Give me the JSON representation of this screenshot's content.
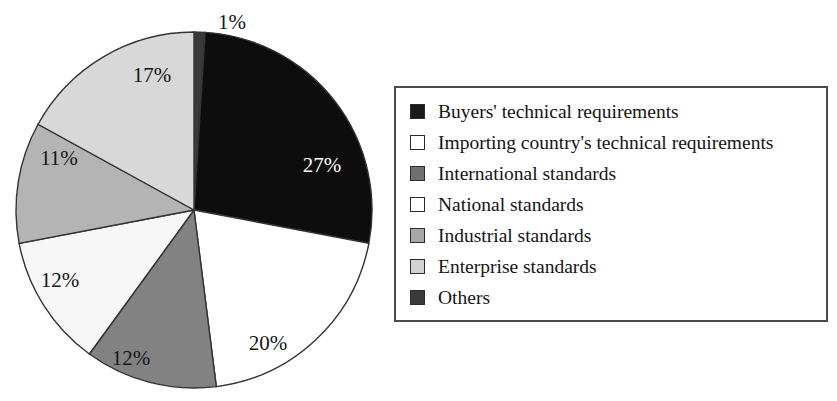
{
  "chart_data": {
    "type": "pie",
    "title": "",
    "subtitle": "",
    "xlabel": "",
    "ylabel": "",
    "grid": false,
    "legend_position": "right",
    "units": "percent",
    "start_angle_deg": 0,
    "direction": "clockwise",
    "categories": [
      "Buyers' technical requirements",
      "Importing country's technical requirements",
      "International standards",
      "National standards",
      "Industrial standards",
      "Enterprise standards",
      "Others"
    ],
    "values": [
      27,
      20,
      12,
      12,
      11,
      17,
      1
    ],
    "value_labels": [
      "27%",
      "20%",
      "12%",
      "12%",
      "11%",
      "17%",
      "1%"
    ],
    "colors": [
      "#0d0d0d",
      "#ffffff",
      "#828282",
      "#f7f7f7",
      "#b4b4b4",
      "#d8d8d8",
      "#3a3a3a"
    ],
    "slices": [
      {
        "name": "Others",
        "label": "1%",
        "value": 1,
        "color": "#3a3a3a",
        "label_color": "#151515",
        "label_x": 232,
        "label_y": 24,
        "start_pct": 0,
        "end_pct": 1
      },
      {
        "name": "Buyers' technical requirements",
        "label": "27%",
        "value": 27,
        "color": "#0d0d0d",
        "label_color": "#ffffff",
        "label_x": 322,
        "label_y": 167,
        "start_pct": 1,
        "end_pct": 28
      },
      {
        "name": "Importing country's technical requirements",
        "label": "20%",
        "value": 20,
        "color": "#ffffff",
        "label_color": "#151515",
        "label_x": 268,
        "label_y": 345,
        "start_pct": 28,
        "end_pct": 48
      },
      {
        "name": "International standards",
        "label": "12%",
        "value": 12,
        "color": "#828282",
        "label_color": "#151515",
        "label_x": 131,
        "label_y": 360,
        "start_pct": 48,
        "end_pct": 60
      },
      {
        "name": "National standards",
        "label": "12%",
        "value": 12,
        "color": "#f7f7f7",
        "label_color": "#151515",
        "label_x": 60,
        "label_y": 282,
        "start_pct": 60,
        "end_pct": 72
      },
      {
        "name": "Industrial standards",
        "label": "11%",
        "value": 11,
        "color": "#b4b4b4",
        "label_color": "#151515",
        "label_x": 59,
        "label_y": 160,
        "start_pct": 72,
        "end_pct": 83
      },
      {
        "name": "Enterprise standards",
        "label": "17%",
        "value": 17,
        "color": "#d8d8d8",
        "label_color": "#151515",
        "label_x": 152,
        "label_y": 77,
        "start_pct": 83,
        "end_pct": 100
      }
    ],
    "geometry": {
      "center_x": 194,
      "center_y": 210,
      "radius": 178,
      "outline_color": "#333333"
    }
  },
  "legend": {
    "border_color": "#4a4a4a",
    "items": [
      {
        "label": "Buyers' technical requirements",
        "swatch": "#1a1a1a"
      },
      {
        "label": "Importing country's technical requirements",
        "swatch": "#ffffff"
      },
      {
        "label": "International standards",
        "swatch": "#6f6f6f"
      },
      {
        "label": "National standards",
        "swatch": "#ffffff"
      },
      {
        "label": "Industrial standards",
        "swatch": "#a8a8a8"
      },
      {
        "label": "Enterprise standards",
        "swatch": "#d2d2d2"
      },
      {
        "label": "Others",
        "swatch": "#3a3a3a"
      }
    ]
  }
}
